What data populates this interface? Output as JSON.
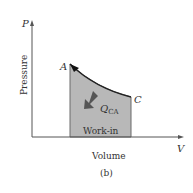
{
  "diagram": {
    "type": "pv_diagram",
    "axes": {
      "y_symbol": "P",
      "y_label": "Pressure",
      "x_symbol": "V",
      "x_label": "Volume"
    },
    "points": [
      {
        "name": "A",
        "x": 70,
        "y": 64
      },
      {
        "name": "C",
        "x": 131,
        "y": 97
      }
    ],
    "process": {
      "from": "C",
      "to": "A",
      "shape": "curve"
    },
    "heat_label_main": "Q",
    "heat_label_sub": "CA",
    "region_label": "Work-in",
    "caption": "(b)",
    "colors": {
      "axis": "#555555",
      "shade": "#b8b8b8",
      "curve": "#222222",
      "arrow": "#555555"
    }
  }
}
